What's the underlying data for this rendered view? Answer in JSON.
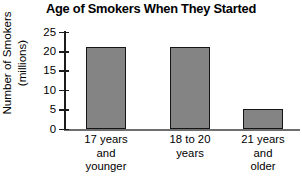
{
  "chart_data": {
    "type": "bar",
    "title": "Age of Smokers When They Started",
    "xlabel": "",
    "ylabel": "Number of Smokers (millions)",
    "ylabel_lines": [
      "Number of Smokers",
      "(millions)"
    ],
    "categories": [
      "17 years and younger",
      "18 to 20 years",
      "21 years and older"
    ],
    "category_lines": [
      [
        "17 years",
        "and",
        "younger"
      ],
      [
        "18 to 20",
        "years"
      ],
      [
        "21 years",
        "and",
        "older"
      ]
    ],
    "values": [
      21,
      21,
      5.2
    ],
    "ylim": [
      0,
      25
    ],
    "yticks": [
      0,
      5,
      10,
      15,
      20,
      25
    ],
    "ytick_labels": [
      "0",
      "5",
      "10",
      "15",
      "20",
      "25"
    ],
    "grid": false,
    "legend": false,
    "bar_fill_color": "#848484",
    "bar_border_color": "#151515",
    "axis_color": "#1c1c1c",
    "text_color": "#000000",
    "background_color": "#ffffff"
  }
}
